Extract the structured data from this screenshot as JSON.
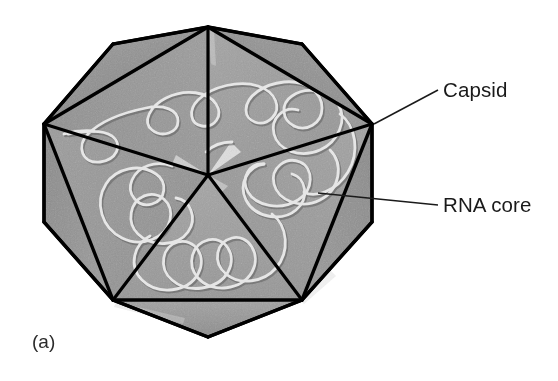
{
  "figure": {
    "panel_label": "(a)",
    "background_color": "#ffffff"
  },
  "labels": [
    {
      "id": "capsid",
      "text": "Capsid",
      "text_x": 443,
      "text_y": 97,
      "leader_from_x": 374,
      "leader_from_y": 124,
      "leader_to_x": 438,
      "leader_to_y": 90,
      "color": "#1a1a1a"
    },
    {
      "id": "rna-core",
      "text": "RNA core",
      "text_x": 443,
      "text_y": 212,
      "leader_from_x": 318,
      "leader_from_y": 193,
      "leader_to_x": 438,
      "leader_to_y": 205,
      "color": "#1a1a1a"
    }
  ],
  "capsid": {
    "outline_color": "#000000",
    "outline_width": 3.2,
    "inner_face_color": "#9a9a9a",
    "outer_face_color": "#8d8d8d",
    "outer_face_color_dark": "#848484",
    "highlight_color": "#efefef",
    "outer_vertices": [
      [
        208,
        27
      ],
      [
        302,
        44
      ],
      [
        372,
        124
      ],
      [
        372,
        222
      ],
      [
        302,
        300
      ],
      [
        208,
        337
      ],
      [
        113,
        300
      ],
      [
        44,
        222
      ],
      [
        44,
        124
      ],
      [
        113,
        44
      ]
    ],
    "inner_vertices": [
      [
        208,
        27
      ],
      [
        372,
        124
      ],
      [
        302,
        300
      ],
      [
        113,
        300
      ],
      [
        44,
        124
      ]
    ],
    "center_vertex": [
      208,
      175
    ],
    "face_count": 10,
    "shape": "icosahedron"
  },
  "rna": {
    "stroke_color": "#e2e2e2",
    "shadow_color": "#6e6e6e",
    "stroke_width": 3.0,
    "description": "single continuous coiled RNA strand with free ends"
  }
}
